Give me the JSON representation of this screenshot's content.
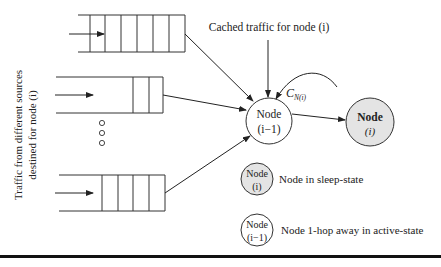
{
  "diagram": {
    "side_label": {
      "line1": "Traffic from different sources",
      "line2": "destined for node (i)"
    },
    "cached_label": "Cached traffic for node (i)",
    "link_label": {
      "main": "C",
      "subscript": "N(i)"
    },
    "node_active": {
      "line1": "Node",
      "line2": "(i−1)"
    },
    "node_sleep": {
      "line1": "Node",
      "line2": "(i)"
    },
    "queues": [
      {
        "name": "queue-top",
        "slots": 6
      },
      {
        "name": "queue-middle",
        "slots": 2
      },
      {
        "name": "queue-bottom",
        "slots": 4
      }
    ],
    "ellipsis": "○○○",
    "legend": [
      {
        "node_line1": "Node",
        "node_line2": "(i)",
        "description": "Node in sleep-state",
        "fill": "#e4e4e4"
      },
      {
        "node_line1": "Node",
        "node_line2": "(i−1)",
        "description": "Node 1-hop away in active-state",
        "fill": "#ffffff"
      }
    ],
    "colors": {
      "stroke": "#333333",
      "sleep_fill": "#e4e4e4",
      "active_fill": "#ffffff"
    }
  }
}
